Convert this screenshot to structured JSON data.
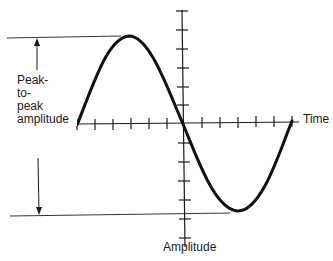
{
  "diagram": {
    "type": "sine-wave-amplitude-diagram",
    "labels": {
      "peak_line1": "Peak-",
      "peak_line2": "to-",
      "peak_line3": "peak",
      "peak_line4": "amplitude",
      "time_axis": "Time",
      "amplitude_axis": "Amplitude"
    },
    "colors": {
      "stroke": "#1a1a1a",
      "reference_line": "#333333",
      "background": "#ffffff"
    },
    "horizontal_axis": {
      "tick_count_left": 6,
      "tick_count_right": 6
    },
    "vertical_axis": {
      "tick_count_up": 6,
      "tick_count_down": 6
    },
    "waveform": {
      "shape": "sine",
      "cycles": 1,
      "starts_at": "origin-left",
      "first_half": "positive"
    }
  }
}
